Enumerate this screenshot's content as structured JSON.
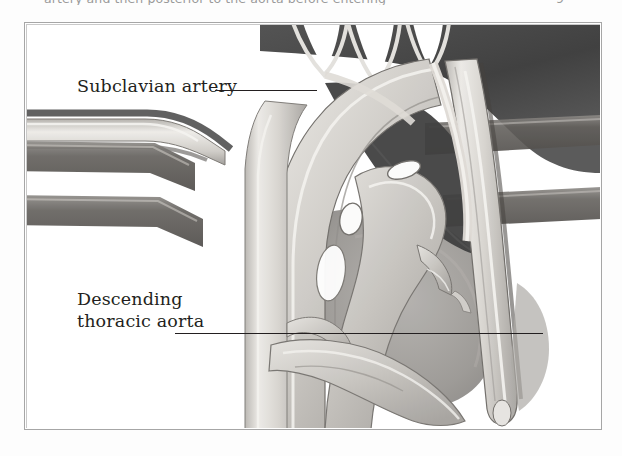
{
  "page": {
    "running_text": "artery and then posterior to the aorta before entering",
    "page_number": "9",
    "background_color": "#ffffff"
  },
  "figure": {
    "frame": {
      "border_color": "#a6a6a6",
      "background_color": "#ffffff"
    },
    "caption_labels": [
      {
        "id": "subclavian",
        "text": "Subclavian artery",
        "leader": true
      },
      {
        "id": "descending",
        "text": "Descending\nthoracic aorta",
        "leader": true
      }
    ],
    "illustration": {
      "name": "aortic-arch-anatomy-illustration",
      "style": "grayscale medical airbrush rendering",
      "palette": {
        "dark_tissue": "#4a4a4a",
        "mid_tissue": "#8f8f8f",
        "light_vessel": "#d8d6d2",
        "highlight": "#f2f1ee",
        "outline": "#6a6a6a",
        "shadow": "#2e2e2e"
      },
      "structures": [
        "branching dark vessels at superior margin",
        "subclavian artery entering from left",
        "aortic arch",
        "ascending aorta",
        "pulmonary artery",
        "descending thoracic aorta (vertical right column)",
        "horizontal banded structures (bronchi/ribs)"
      ]
    }
  }
}
